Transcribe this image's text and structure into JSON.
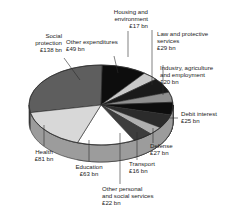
{
  "chart_data": {
    "type": "pie",
    "title": "",
    "subtitle": "",
    "xlabel": "",
    "ylabel": "",
    "units": "£ bn",
    "legend_position": "callout-labels",
    "grid": false,
    "three_d": true,
    "total": 477,
    "categories": [
      "Social protection",
      "Other expenditures",
      "Housing and environment",
      "Law and protective services",
      "Industry, agriculture and employment",
      "Debit interest",
      "Defense",
      "Transport",
      "Other personal and social services",
      "Education",
      "Health"
    ],
    "values": [
      138,
      49,
      17,
      29,
      20,
      25,
      27,
      16,
      22,
      63,
      81
    ],
    "labels": [
      "Social protection\n£138 bn",
      "Other expenditures\n£49 bn",
      "Housing and\nenvironment\n£17 bn",
      "Law and protective\nservices\n£29 bn",
      "Industry, agriculture\nand employment\n£20 bn",
      "Debit interest\n£25 bn",
      "Defense\n£27 bn",
      "Transport\n£16 bn",
      "Other personal\nand social services\n£22 bn",
      "Education\n£63 bn",
      "Health\n£81 bn"
    ],
    "colors": [
      "#5e5e5e",
      "#0d0d0d",
      "#c9c9c9",
      "#1a1a1a",
      "#8f8f8f",
      "#0d0d0d",
      "#2b2b2b",
      "#b0b0b0",
      "#3d3d3d",
      "#ffffff",
      "#d8d8d8"
    ]
  },
  "slices": [
    {
      "name": "social-protection",
      "category": "Social protection",
      "value": 138,
      "value_label": "£138 bn",
      "color": "#5e5e5e"
    },
    {
      "name": "other-expenditures",
      "category": "Other expenditures",
      "value": 49,
      "value_label": "£49 bn",
      "color": "#0d0d0d"
    },
    {
      "name": "housing-and-environment",
      "category": "Housing and environment",
      "value": 17,
      "value_label": "£17 bn",
      "color": "#c9c9c9"
    },
    {
      "name": "law-and-protective-services",
      "category": "Law and protective services",
      "value": 29,
      "value_label": "£29 bn",
      "color": "#1a1a1a"
    },
    {
      "name": "industry-agriculture-and-employment",
      "category": "Industry, agriculture and employment",
      "value": 20,
      "value_label": "£20 bn",
      "color": "#8f8f8f"
    },
    {
      "name": "debit-interest",
      "category": "Debit interest",
      "value": 25,
      "value_label": "£25 bn",
      "color": "#0d0d0d"
    },
    {
      "name": "defense",
      "category": "Defense",
      "value": 27,
      "value_label": "£27 bn",
      "color": "#2b2b2b"
    },
    {
      "name": "transport",
      "category": "Transport",
      "value": 16,
      "value_label": "£16 bn",
      "color": "#b0b0b0"
    },
    {
      "name": "other-personal-and-social-services",
      "category": "Other personal and social services",
      "value": 22,
      "value_label": "£22 bn",
      "color": "#3d3d3d"
    },
    {
      "name": "education",
      "category": "Education",
      "value": 63,
      "value_label": "£63 bn",
      "color": "#ffffff"
    },
    {
      "name": "health",
      "category": "Health",
      "value": 81,
      "value_label": "£81 bn",
      "color": "#d8d8d8"
    }
  ],
  "callouts": {
    "social_protection": {
      "line1": "Social",
      "line2": "protection",
      "line3": "£138 bn"
    },
    "other_expenditures": {
      "line1": "Other expenditures",
      "line2": "£49 bn"
    },
    "housing": {
      "line1": "Housing and",
      "line2": "environment",
      "line3": "£17 bn"
    },
    "law": {
      "line1": "Law and protective",
      "line2": "services",
      "line3": "£29 bn"
    },
    "industry": {
      "line1": "Industry, agriculture",
      "line2": "and employment",
      "line3": "£20 bn"
    },
    "debit_interest": {
      "line1": "Debit interest",
      "line2": "£25 bn"
    },
    "defense": {
      "line1": "Defense",
      "line2": "£27 bn"
    },
    "transport": {
      "line1": "Transport",
      "line2": "£16 bn"
    },
    "other_personal": {
      "line1": "Other personal",
      "line2": "and social services",
      "line3": "£22 bn"
    },
    "education": {
      "line1": "Education",
      "line2": "£63 bn"
    },
    "health": {
      "line1": "Health",
      "line2": "£81 bn"
    }
  }
}
